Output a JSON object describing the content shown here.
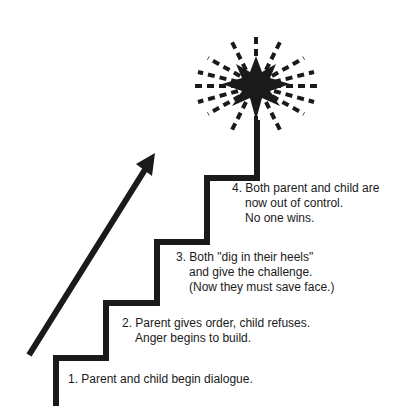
{
  "colors": {
    "ink": "#1a1a1a",
    "background": "#ffffff"
  },
  "steps": [
    {
      "number": "1.",
      "lines": [
        "1. Parent and child begin dialogue."
      ]
    },
    {
      "number": "2.",
      "lines": [
        "2. Parent gives order, child refuses.",
        "Anger begins to build."
      ]
    },
    {
      "number": "3.",
      "lines": [
        "3. Both \"dig in their heels\"",
        "and give the challenge.",
        "(Now they must save face.)"
      ]
    },
    {
      "number": "4.",
      "lines": [
        "4. Both parent and child are",
        "now out of control.",
        "No one wins."
      ]
    }
  ],
  "icons": {
    "arrow": "up-right-arrow-icon",
    "burst": "explosion-starburst-icon"
  }
}
